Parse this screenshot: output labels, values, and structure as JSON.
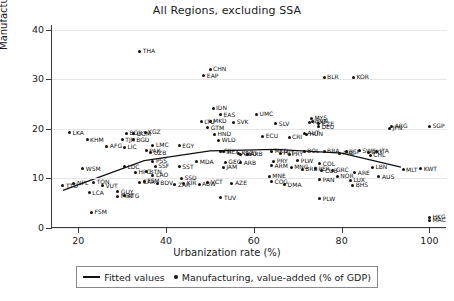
{
  "chart_data": {
    "type": "scatter",
    "title": "All Regions, excluding SSA",
    "xlabel": "Urbanization rate (%)",
    "ylabel": "Manufacturing Shares of GDP (%)",
    "xlim": [
      14,
      104
    ],
    "ylim": [
      0,
      41
    ],
    "xticks": [
      20,
      40,
      60,
      80,
      100
    ],
    "yticks": [
      0,
      10,
      20,
      30,
      40
    ],
    "grid": "horizontal",
    "legend_position": "bottom",
    "legend": [
      {
        "marker": "line",
        "label": "Fitted values"
      },
      {
        "marker": "dot",
        "label": "Manufacturing, value-added (% of GDP)"
      }
    ],
    "point_label_field": "code",
    "series": [
      {
        "name": "Manufacturing, value-added (% of GDP)",
        "points": [
          {
            "code": "THA",
            "x": 34.0,
            "y": 35.7
          },
          {
            "code": "CHN",
            "x": 50.0,
            "y": 32.1
          },
          {
            "code": "EAP",
            "x": 48.6,
            "y": 30.7
          },
          {
            "code": "BLR",
            "x": 76.0,
            "y": 30.4
          },
          {
            "code": "KOR",
            "x": 82.7,
            "y": 30.4
          },
          {
            "code": "IDN",
            "x": 50.7,
            "y": 24.2
          },
          {
            "code": "EAS",
            "x": 52.4,
            "y": 22.9
          },
          {
            "code": "UMC",
            "x": 60.6,
            "y": 23.0
          },
          {
            "code": "MYS",
            "x": 73.1,
            "y": 22.2
          },
          {
            "code": "SVN",
            "x": 73.4,
            "y": 21.6
          },
          {
            "code": "ROU",
            "x": 72.7,
            "y": 21.4
          },
          {
            "code": "CZE",
            "x": 74.8,
            "y": 21.1
          },
          {
            "code": "SVK",
            "x": 55.4,
            "y": 21.4
          },
          {
            "code": "SLV",
            "x": 65.0,
            "y": 21.1
          },
          {
            "code": "DEU",
            "x": 74.7,
            "y": 20.5
          },
          {
            "code": "ARG",
            "x": 91.4,
            "y": 20.6
          },
          {
            "code": "JPN",
            "x": 90.9,
            "y": 20.1
          },
          {
            "code": "SGP",
            "x": 100.0,
            "y": 20.6
          },
          {
            "code": "LKA",
            "x": 18.0,
            "y": 19.2
          },
          {
            "code": "KGZ",
            "x": 35.2,
            "y": 19.3
          },
          {
            "code": "BGR",
            "x": 31.0,
            "y": 19.1
          },
          {
            "code": "DOM",
            "x": 32.6,
            "y": 19.0
          },
          {
            "code": "LTU",
            "x": 48.0,
            "y": 21.5
          },
          {
            "code": "MKD",
            "x": 50.0,
            "y": 21.6
          },
          {
            "code": "GTM",
            "x": 49.5,
            "y": 20.2
          },
          {
            "code": "AUT",
            "x": 71.5,
            "y": 19.1
          },
          {
            "code": "HUN",
            "x": 72.0,
            "y": 18.9
          },
          {
            "code": "KHM",
            "x": 22.0,
            "y": 17.8
          },
          {
            "code": "TJK",
            "x": 30.0,
            "y": 17.8
          },
          {
            "code": "BGD",
            "x": 32.5,
            "y": 17.8
          },
          {
            "code": "LIC",
            "x": 30.5,
            "y": 16.3
          },
          {
            "code": "AFG",
            "x": 26.5,
            "y": 16.5
          },
          {
            "code": "HND",
            "x": 51.0,
            "y": 18.9
          },
          {
            "code": "ECU",
            "x": 62.0,
            "y": 18.5
          },
          {
            "code": "CRI",
            "x": 68.0,
            "y": 18.3
          },
          {
            "code": "WLD",
            "x": 52.0,
            "y": 17.7
          },
          {
            "code": "EGY",
            "x": 43.0,
            "y": 16.6
          },
          {
            "code": "LMC",
            "x": 37.0,
            "y": 16.7
          },
          {
            "code": "PAK",
            "x": 35.5,
            "y": 15.6
          },
          {
            "code": "UZB",
            "x": 36.5,
            "y": 15.2
          },
          {
            "code": "MEX",
            "x": 53.0,
            "y": 15.4
          },
          {
            "code": "FJI",
            "x": 52.5,
            "y": 15.5
          },
          {
            "code": "KAZ",
            "x": 56.5,
            "y": 15.1
          },
          {
            "code": "GEO",
            "x": 57.0,
            "y": 14.9
          },
          {
            "code": "ARB",
            "x": 58.5,
            "y": 14.9
          },
          {
            "code": "MKD2",
            "x": 64.0,
            "y": 15.5
          },
          {
            "code": "PRT",
            "x": 66.0,
            "y": 15.1
          },
          {
            "code": "PRY",
            "x": 68.0,
            "y": 14.9
          },
          {
            "code": "BOL",
            "x": 71.5,
            "y": 15.5
          },
          {
            "code": "BRA",
            "x": 76.0,
            "y": 15.5
          },
          {
            "code": "ARE",
            "x": 79.5,
            "y": 15.1
          },
          {
            "code": "ESP",
            "x": 81.0,
            "y": 15.4
          },
          {
            "code": "SWE",
            "x": 84.0,
            "y": 15.6
          },
          {
            "code": "URY",
            "x": 86.0,
            "y": 15.3
          },
          {
            "code": "ITA",
            "x": 88.0,
            "y": 15.5
          },
          {
            "code": "CHL",
            "x": 86.5,
            "y": 14.7
          },
          {
            "code": "WSM",
            "x": 21.0,
            "y": 12.0
          },
          {
            "code": "LDC",
            "x": 30.5,
            "y": 12.4
          },
          {
            "code": "PSS",
            "x": 37.0,
            "y": 13.5
          },
          {
            "code": "SSF",
            "x": 37.5,
            "y": 12.5
          },
          {
            "code": "HPC",
            "x": 33.0,
            "y": 11.3
          },
          {
            "code": "BTN",
            "x": 35.5,
            "y": 11.4
          },
          {
            "code": "LAO",
            "x": 37.0,
            "y": 10.7
          },
          {
            "code": "MDA",
            "x": 47.0,
            "y": 13.4
          },
          {
            "code": "GEO2",
            "x": 53.5,
            "y": 13.3
          },
          {
            "code": "ARB2",
            "x": 57.0,
            "y": 13.2
          },
          {
            "code": "PRY2",
            "x": 64.5,
            "y": 13.5
          },
          {
            "code": "PLW2",
            "x": 70.0,
            "y": 13.6
          },
          {
            "code": "ARM",
            "x": 64.0,
            "y": 12.6
          },
          {
            "code": "COL",
            "x": 75.0,
            "y": 13.0
          },
          {
            "code": "PER",
            "x": 74.0,
            "y": 12.0
          },
          {
            "code": "BRB",
            "x": 71.0,
            "y": 11.9
          },
          {
            "code": "CUB",
            "x": 75.5,
            "y": 11.6
          },
          {
            "code": "GRC",
            "x": 78.0,
            "y": 11.7
          },
          {
            "code": "KWT",
            "x": 98.0,
            "y": 12.0
          },
          {
            "code": "LBN",
            "x": 87.0,
            "y": 12.3
          },
          {
            "code": "MLT",
            "x": 94.0,
            "y": 11.8
          },
          {
            "code": "ARE2",
            "x": 83.0,
            "y": 11.2
          },
          {
            "code": "NOR",
            "x": 79.0,
            "y": 10.5
          },
          {
            "code": "AUS",
            "x": 88.5,
            "y": 10.4
          },
          {
            "code": "TON",
            "x": 23.5,
            "y": 9.2
          },
          {
            "code": "VUT",
            "x": 25.5,
            "y": 8.5
          },
          {
            "code": "FSM2",
            "x": 35.0,
            "y": 9.4
          },
          {
            "code": "ZAR",
            "x": 42.0,
            "y": 8.7
          },
          {
            "code": "SST",
            "x": 43.0,
            "y": 12.4
          },
          {
            "code": "JAM",
            "x": 53.0,
            "y": 12.3
          },
          {
            "code": "MNE",
            "x": 63.5,
            "y": 10.5
          },
          {
            "code": "MNG",
            "x": 68.5,
            "y": 12.3
          },
          {
            "code": "PAN",
            "x": 75.0,
            "y": 9.7
          },
          {
            "code": "BHS",
            "x": 82.5,
            "y": 8.6
          },
          {
            "code": "LUX",
            "x": 82.0,
            "y": 9.6
          },
          {
            "code": "COG",
            "x": 64.0,
            "y": 9.3
          },
          {
            "code": "DMA",
            "x": 67.0,
            "y": 8.7
          },
          {
            "code": "KIR",
            "x": 44.0,
            "y": 9.0
          },
          {
            "code": "SSD",
            "x": 43.5,
            "y": 10.0
          },
          {
            "code": "ABW",
            "x": 47.5,
            "y": 8.8
          },
          {
            "code": "VCT",
            "x": 49.5,
            "y": 9.2
          },
          {
            "code": "AZE",
            "x": 55.0,
            "y": 9.0
          },
          {
            "code": "BDV",
            "x": 38.0,
            "y": 9.0
          },
          {
            "code": "CAR",
            "x": 34.0,
            "y": 9.2
          },
          {
            "code": "GUY",
            "x": 29.0,
            "y": 7.3
          },
          {
            "code": "ATG",
            "x": 30.5,
            "y": 6.5
          },
          {
            "code": "MRT",
            "x": 29.0,
            "y": 6.4
          },
          {
            "code": "LCA",
            "x": 22.5,
            "y": 7.1
          },
          {
            "code": "NPL",
            "x": 19.0,
            "y": 9.0
          },
          {
            "code": "TTO",
            "x": 16.5,
            "y": 8.5
          },
          {
            "code": "TUV",
            "x": 52.5,
            "y": 6.1
          },
          {
            "code": "PLW",
            "x": 75.0,
            "y": 5.9
          },
          {
            "code": "FSM",
            "x": 23.0,
            "y": 3.2
          },
          {
            "code": "HKG",
            "x": 100.0,
            "y": 2.2
          },
          {
            "code": "MAC",
            "x": 100.0,
            "y": 1.6
          }
        ]
      }
    ],
    "fitted_line": {
      "name": "Fitted values",
      "points": [
        {
          "x": 16.5,
          "y": 7.6
        },
        {
          "x": 35.0,
          "y": 13.6
        },
        {
          "x": 50.0,
          "y": 15.6
        },
        {
          "x": 65.0,
          "y": 15.9
        },
        {
          "x": 80.0,
          "y": 15.1
        },
        {
          "x": 93.5,
          "y": 12.3
        }
      ]
    }
  }
}
